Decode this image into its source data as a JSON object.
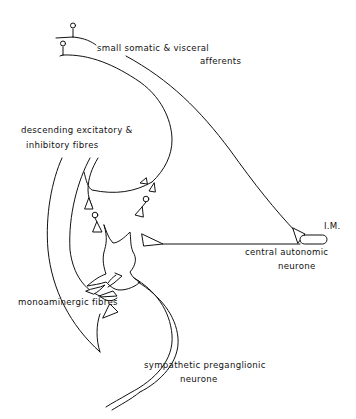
{
  "diagram": {
    "labels": {
      "afferents_line1": "small  somatic  &  visceral",
      "afferents_line2": "afferents",
      "descending_line1": "descending  excitatory &",
      "descending_line2": "inhibitory  fibres",
      "im": "I.M.",
      "central_line1": "central  autonomic",
      "central_line2": "neurone",
      "monoaminergic": "monoaminergic   fibres",
      "spn_line1": "sympathetic  preganglionic",
      "spn_line2": "neurone"
    },
    "colors": {
      "stroke": "#111111",
      "background": "#ffffff"
    }
  }
}
